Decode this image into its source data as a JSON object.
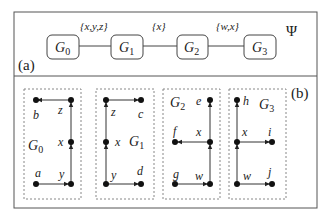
{
  "panel_a": {
    "label": "(a)",
    "psi": "Ψ",
    "nodes": [
      {
        "id": "G0",
        "base": "G",
        "sub": "0"
      },
      {
        "id": "G1",
        "base": "G",
        "sub": "1"
      },
      {
        "id": "G2",
        "base": "G",
        "sub": "2"
      },
      {
        "id": "G3",
        "base": "G",
        "sub": "3"
      }
    ],
    "edges": [
      {
        "from": "G0",
        "to": "G1",
        "label": "{x,y,z}"
      },
      {
        "from": "G1",
        "to": "G2",
        "label": "{x}"
      },
      {
        "from": "G2",
        "to": "G3",
        "label": "{w,x}"
      }
    ]
  },
  "panel_b": {
    "label": "(b)",
    "graphs": [
      {
        "name_base": "G",
        "name_sub": "0",
        "vertices": [
          "b",
          "z",
          "x",
          "a",
          "y"
        ],
        "edges": [
          "a→y",
          "y→x",
          "x→z",
          "z→b"
        ]
      },
      {
        "name_base": "G",
        "name_sub": "1",
        "vertices": [
          "z",
          "c",
          "x",
          "y",
          "d"
        ],
        "edges": [
          "y→d",
          "y→x",
          "x→z",
          "z→c"
        ]
      },
      {
        "name_base": "G",
        "name_sub": "2",
        "vertices": [
          "e",
          "f",
          "x",
          "g",
          "w"
        ],
        "edges": [
          "g→w",
          "w→x",
          "x→e",
          "x→f"
        ]
      },
      {
        "name_base": "G",
        "name_sub": "3",
        "vertices": [
          "h",
          "x",
          "i",
          "w",
          "j"
        ],
        "edges": [
          "w→j",
          "w→x",
          "x→h",
          "x→i"
        ]
      }
    ]
  }
}
